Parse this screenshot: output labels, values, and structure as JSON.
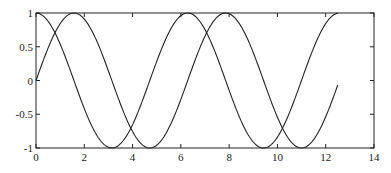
{
  "chart_data": {
    "type": "line",
    "title": "",
    "xlabel": "",
    "ylabel": "",
    "xlim": [
      0,
      14
    ],
    "ylim": [
      -1,
      1
    ],
    "grid": false,
    "legend": null,
    "x_ticks": [
      "0",
      "2",
      "4",
      "6",
      "8",
      "10",
      "12",
      "14"
    ],
    "y_ticks": [
      "1",
      "0.5",
      "0",
      "-0.5",
      "-1"
    ],
    "x_tick_values": [
      0,
      2,
      4,
      6,
      8,
      10,
      12,
      14
    ],
    "y_tick_values": [
      1,
      0.5,
      0,
      -0.5,
      -1
    ],
    "x_range_of_data": [
      0,
      12.5
    ],
    "series": [
      {
        "name": "sin(x)",
        "function": "sin",
        "x": [
          0,
          1.57,
          3.14,
          4.71,
          6.28,
          7.85,
          9.42,
          11.0,
          12.5
        ],
        "values": [
          0,
          1,
          0,
          -1,
          0,
          1,
          0,
          -1,
          -0.07
        ]
      },
      {
        "name": "cos(x)",
        "function": "cos",
        "x": [
          0,
          1.57,
          3.14,
          4.71,
          6.28,
          7.85,
          9.42,
          11.0,
          12.5
        ],
        "values": [
          1,
          0,
          -1,
          0,
          1,
          0,
          -1,
          0,
          1
        ]
      }
    ]
  }
}
